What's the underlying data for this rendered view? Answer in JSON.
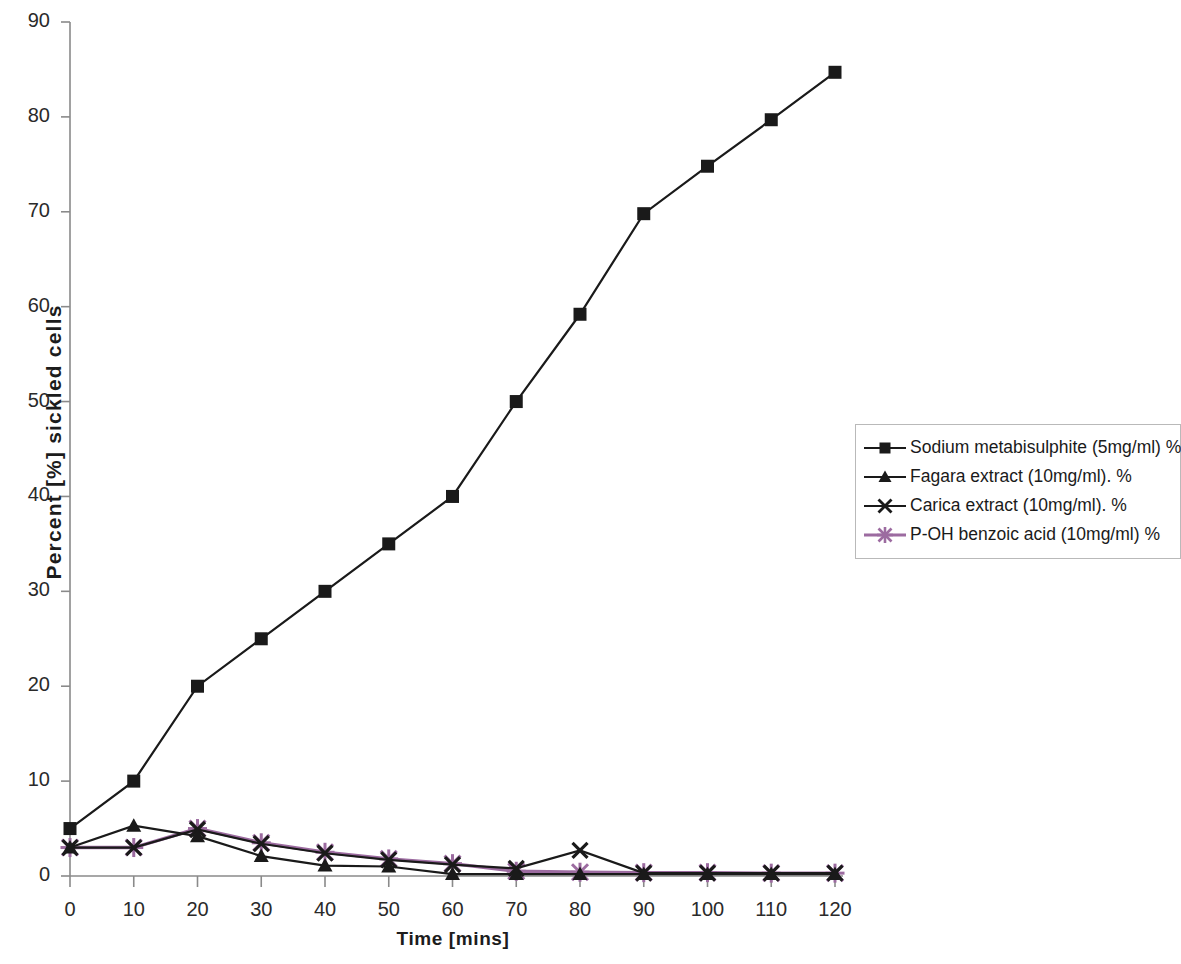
{
  "chart_data": {
    "type": "line",
    "title": "",
    "xlabel": "Time [mins]",
    "ylabel": "Percent [%] sickled cells",
    "x": [
      0,
      10,
      20,
      30,
      40,
      50,
      60,
      70,
      80,
      90,
      100,
      110,
      120
    ],
    "xlim": [
      0,
      120
    ],
    "ylim": [
      0,
      90
    ],
    "xticks": [
      "0",
      "10",
      "20",
      "30",
      "40",
      "50",
      "60",
      "70",
      "80",
      "90",
      "100",
      "110",
      "120"
    ],
    "yticks": [
      "0",
      "10",
      "20",
      "30",
      "40",
      "50",
      "60",
      "70",
      "80",
      "90"
    ],
    "grid": false,
    "legend_position": "right",
    "series": [
      {
        "name": "Sodium metabisulphite (5mg/ml) %",
        "marker": "square",
        "color": "#1a1a1a",
        "values": [
          5,
          10,
          20,
          25,
          30,
          35,
          40,
          50,
          59.2,
          69.8,
          74.8,
          79.7,
          84.7
        ]
      },
      {
        "name": "Fagara extract (10mg/ml). %",
        "marker": "triangle",
        "color": "#1a1a1a",
        "values": [
          3,
          5.3,
          4.2,
          2.1,
          1.1,
          1.0,
          0.2,
          0.2,
          0.2,
          0.2,
          0.2,
          0.2,
          0.2
        ]
      },
      {
        "name": "Carica extract (10mg/ml). %",
        "marker": "cross",
        "color": "#1a1a1a",
        "values": [
          3,
          3,
          4.9,
          3.4,
          2.4,
          1.7,
          1.2,
          0.8,
          2.7,
          0.3,
          0.3,
          0.3,
          0.3
        ]
      },
      {
        "name": "P-OH benzoic acid (10mg/ml) %",
        "marker": "star",
        "color": "#9c6ba0",
        "values": [
          3,
          3,
          5.0,
          3.5,
          2.5,
          1.8,
          1.3,
          0.5,
          0.4,
          0.35,
          0.35,
          0.3,
          0.3
        ]
      }
    ]
  },
  "axes": {
    "x_title": "Time [mins]",
    "y_title": "Percent [%] sickled cells"
  },
  "legend": {
    "items": [
      {
        "label": "Sodium metabisulphite (5mg/ml) %"
      },
      {
        "label": "Fagara extract (10mg/ml). %"
      },
      {
        "label": "Carica extract (10mg/ml). %"
      },
      {
        "label": "P-OH benzoic acid (10mg/ml) %"
      }
    ]
  },
  "colors": {
    "axis": "#8a8a8a",
    "ink": "#1a1a1a",
    "purple": "#9c6ba0"
  }
}
